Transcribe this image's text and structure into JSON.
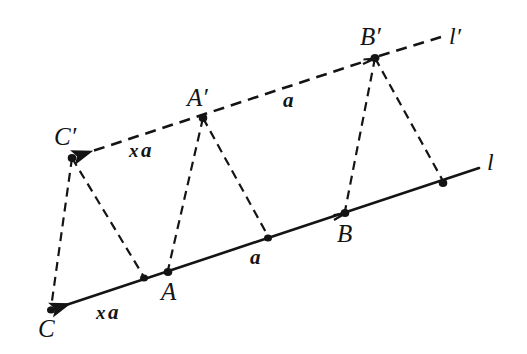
{
  "figure": {
    "background_color": "#ffffff",
    "stroke_color": "#141414",
    "width": 527,
    "height": 354
  },
  "lines": {
    "l": {
      "name": "l",
      "label": "l",
      "style": "solid",
      "label_pos": {
        "x": 487,
        "y": 150
      },
      "arrow_end": "C",
      "from": {
        "x": 51,
        "y": 310
      },
      "to": {
        "x": 479,
        "y": 168
      }
    },
    "l_prime": {
      "name": "l'",
      "label": "l′",
      "style": "dashed",
      "label_pos": {
        "x": 449,
        "y": 24
      },
      "arrow_ends": [
        "C'",
        "B'"
      ],
      "from": {
        "x": 72,
        "y": 158
      },
      "to": {
        "x": 441,
        "y": 37
      }
    }
  },
  "points": [
    {
      "id": "C",
      "label": "C",
      "x": 51,
      "y": 310,
      "on": "l",
      "label_pos": {
        "x": 38,
        "y": 316
      },
      "labeled": true
    },
    {
      "id": "P1",
      "label": "",
      "x": 144,
      "y": 278,
      "on": "l",
      "labeled": false
    },
    {
      "id": "A",
      "label": "A",
      "x": 168,
      "y": 272,
      "on": "l",
      "label_pos": {
        "x": 161,
        "y": 279
      },
      "labeled": true
    },
    {
      "id": "M",
      "label": "",
      "x": 268,
      "y": 238,
      "on": "l",
      "labeled": false
    },
    {
      "id": "B",
      "label": "B",
      "x": 345,
      "y": 213,
      "on": "l",
      "label_pos": {
        "x": 337,
        "y": 221
      },
      "labeled": true
    },
    {
      "id": "P2",
      "label": "",
      "x": 443,
      "y": 183,
      "on": "l",
      "labeled": false
    },
    {
      "id": "Cprime",
      "label": "C′",
      "x": 72,
      "y": 158,
      "on": "l'",
      "label_pos": {
        "x": 54,
        "y": 124
      },
      "labeled": true
    },
    {
      "id": "Aprime",
      "label": "A′",
      "x": 203,
      "y": 118,
      "on": "l'",
      "label_pos": {
        "x": 187,
        "y": 85
      },
      "labeled": true
    },
    {
      "id": "Bprime",
      "label": "B′",
      "x": 375,
      "y": 58,
      "on": "l'",
      "label_pos": {
        "x": 360,
        "y": 24
      },
      "labeled": true
    }
  ],
  "connectors": [
    {
      "name": "Cprime-to-C",
      "from": "Cprime",
      "to": "C",
      "style": "dashed"
    },
    {
      "name": "Cprime-to-P1",
      "from": "Cprime",
      "to": "P1",
      "style": "dashed"
    },
    {
      "name": "Aprime-to-A",
      "from": "Aprime",
      "to": "A",
      "style": "dashed"
    },
    {
      "name": "Aprime-to-M",
      "from": "Aprime",
      "to": "M",
      "style": "dashed"
    },
    {
      "name": "Bprime-to-B",
      "from": "Bprime",
      "to": "B",
      "style": "dashed"
    },
    {
      "name": "Bprime-to-P2",
      "from": "Bprime",
      "to": "P2",
      "style": "dashed"
    }
  ],
  "vector_labels": [
    {
      "name": "upper-xa",
      "x_part": "x",
      "a_part": "a",
      "text": "x a",
      "pos": {
        "x": 129,
        "y": 140
      },
      "segment": "C'-A'"
    },
    {
      "name": "upper-a",
      "x_part": "",
      "a_part": "a",
      "text": "a",
      "pos": {
        "x": 283,
        "y": 90
      },
      "segment": "A'-B'"
    },
    {
      "name": "lower-xa",
      "x_part": "x",
      "a_part": "a",
      "text": "x a",
      "pos": {
        "x": 96,
        "y": 302
      },
      "segment": "C-A"
    },
    {
      "name": "lower-a",
      "x_part": "",
      "a_part": "a",
      "text": "a",
      "pos": {
        "x": 250,
        "y": 247
      },
      "segment": "A-B"
    }
  ]
}
